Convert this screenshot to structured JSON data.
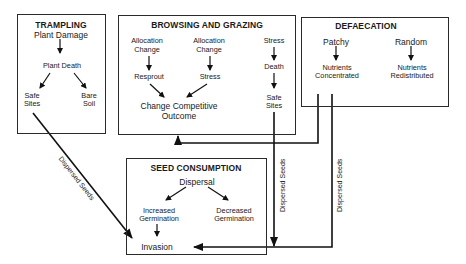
{
  "boxes": {
    "trampling": {
      "title": "TRAMPLING",
      "nodes": {
        "plant_damage": "Plant Damage",
        "plant_death": "Plant Death",
        "safe_sites_1": "Safe",
        "safe_sites_2": "Sites",
        "bare_soil_1": "Bare",
        "bare_soil_2": "Soil"
      }
    },
    "browsing": {
      "title": "BROWSING AND GRAZING",
      "nodes": {
        "alloc1_1": "Allocation",
        "alloc1_2": "Change",
        "alloc2_1": "Allocation",
        "alloc2_2": "Change",
        "resprout": "Resprout",
        "stress_mid": "Stress",
        "stress_right": "Stress",
        "death": "Death",
        "safe_sites_1": "Safe",
        "safe_sites_2": "Sites",
        "outcome_1": "Change Competitive",
        "outcome_2": "Outcome"
      }
    },
    "defaecation": {
      "title": "DEFAECATION",
      "nodes": {
        "patchy": "Patchy",
        "random": "Random",
        "nutrients_conc_1": "Nutrients",
        "nutrients_conc_2": "Concentrated",
        "nutrients_redis_1": "Nutrients",
        "nutrients_redis_2": "Redistributed"
      }
    },
    "seed_consumption": {
      "title": "SEED CONSUMPTION",
      "nodes": {
        "dispersal": "Dispersal",
        "increased_1": "Increased",
        "increased_2": "Germination",
        "decreased_1": "Decreased",
        "decreased_2": "Germination",
        "invasion": "Invasion"
      }
    }
  },
  "connectors": {
    "trampling_to_invasion": "Dispersed Seeds",
    "browsing_to_invasion": "Dispersed Seeds",
    "defaecation_to_invasion": "Dispersed Seeds"
  }
}
